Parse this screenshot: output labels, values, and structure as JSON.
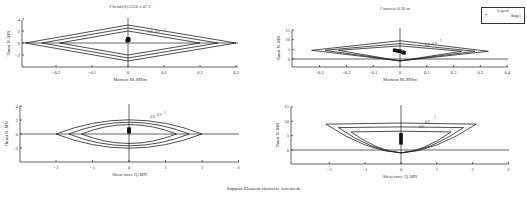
{
  "figure": {
    "caption": "Support Element shotcrete wiremesh",
    "legend": {
      "title": "Legend",
      "entries": [
        {
          "marker": "*",
          "label": "Stage1"
        }
      ]
    }
  },
  "chart_data": [
    {
      "id": "tl",
      "type": "line",
      "title": "I-beam(S):5310 x 47.3",
      "xlabel": "Moment M–MNm",
      "ylabel": "Thrust N–MN",
      "xlim": [
        -0.3,
        0.3
      ],
      "ylim": [
        -4,
        4
      ],
      "xticks": [
        -0.2,
        -0.1,
        0,
        0.1,
        0.2,
        0.3
      ],
      "yticks": [
        4,
        2,
        0,
        -2
      ],
      "curve_labels": [
        "0.8",
        "0.9",
        "1"
      ],
      "series": [
        {
          "name": "FS=1",
          "points": [
            [
              -0.285,
              0
            ],
            [
              0,
              3
            ],
            [
              0.3,
              0
            ],
            [
              0,
              -3
            ],
            [
              -0.285,
              0
            ]
          ]
        },
        {
          "name": "FS=0.9",
          "points": [
            [
              -0.24,
              0
            ],
            [
              0,
              2.5
            ],
            [
              0.25,
              0
            ],
            [
              0,
              -2.5
            ],
            [
              -0.24,
              0
            ]
          ]
        },
        {
          "name": "FS=0.8",
          "points": [
            [
              -0.19,
              0
            ],
            [
              0,
              2
            ],
            [
              0.2,
              0
            ],
            [
              0,
              -2
            ],
            [
              -0.19,
              0
            ]
          ]
        }
      ],
      "stage_points": {
        "name": "Stage1",
        "x": [
          -0.002,
          0,
          0.002,
          0.001
        ],
        "y": [
          0.4,
          0.7,
          0.5,
          0.6
        ]
      }
    },
    {
      "id": "tr",
      "type": "line",
      "title": "Concrete:0.36 m",
      "xlabel": "Moment M–MNm",
      "ylabel": "Thrust N–MN",
      "xlim": [
        -0.4,
        0.4
      ],
      "ylim": [
        -5,
        15
      ],
      "xticks": [
        -0.3,
        -0.2,
        -0.1,
        0,
        0.1,
        0.2,
        0.3,
        0.4
      ],
      "yticks": [
        15,
        10,
        5,
        0
      ],
      "curve_labels": [
        "0.8",
        "0.9",
        "1"
      ],
      "series": [
        {
          "name": "FS=1",
          "points": [
            [
              -0.33,
              4.5
            ],
            [
              0,
              9.5
            ],
            [
              0.33,
              4
            ],
            [
              0,
              -1
            ],
            [
              -0.33,
              4.5
            ]
          ]
        },
        {
          "name": "FS=0.9",
          "points": [
            [
              -0.28,
              4.5
            ],
            [
              0,
              8
            ],
            [
              0.28,
              4
            ],
            [
              0,
              -1
            ],
            [
              -0.28,
              4.5
            ]
          ]
        },
        {
          "name": "FS=0.8",
          "points": [
            [
              -0.23,
              4.5
            ],
            [
              0,
              6.8
            ],
            [
              0.23,
              4
            ],
            [
              0,
              -1
            ],
            [
              -0.23,
              4.5
            ]
          ]
        }
      ],
      "stage_points": {
        "name": "Stage1",
        "x": [
          -0.02,
          -0.01,
          0,
          0.01,
          0.015
        ],
        "y": [
          4.5,
          4.2,
          4.0,
          3.5,
          3.2
        ]
      }
    },
    {
      "id": "bl",
      "type": "line",
      "title": "",
      "xlabel": "Shear force Q–MN",
      "ylabel": "Thrust N–MN",
      "xlim": [
        -3,
        3
      ],
      "ylim": [
        -4,
        4
      ],
      "xticks": [
        -2,
        -1,
        0,
        1,
        2,
        3
      ],
      "yticks": [
        4,
        2,
        0,
        -2
      ],
      "curve_labels": [
        "0.8",
        "0.9",
        "1"
      ],
      "series": [
        {
          "name": "FS=1",
          "outer_x": 2.0,
          "top": 3,
          "bottom": -3
        },
        {
          "name": "FS=0.9",
          "outer_x": 1.65,
          "top": 2.5,
          "bottom": -2.5
        },
        {
          "name": "FS=0.8",
          "outer_x": 1.3,
          "top": 2,
          "bottom": -2
        }
      ],
      "stage_points": {
        "name": "Stage1",
        "x": [
          0,
          0,
          0
        ],
        "y": [
          0.3,
          0.5,
          0.7
        ]
      }
    },
    {
      "id": "br",
      "type": "line",
      "title": "",
      "xlabel": "Shear force Q–MN",
      "ylabel": "Thrust N–MN",
      "xlim": [
        -3,
        3
      ],
      "ylim": [
        -5,
        15
      ],
      "xticks": [
        -2,
        -1,
        0,
        1,
        2,
        3
      ],
      "yticks": [
        15,
        10,
        5,
        0
      ],
      "curve_labels": [
        "0.8",
        "0.9",
        "1"
      ],
      "series": [
        {
          "name": "FS=1",
          "outer_x": 2.1,
          "top": 9.8,
          "corner": 9,
          "bottom": -1
        },
        {
          "name": "FS=0.9",
          "outer_x": 1.75,
          "top": 8.3,
          "corner": 7.8,
          "bottom": -1
        },
        {
          "name": "FS=0.8",
          "outer_x": 1.4,
          "top": 6.8,
          "corner": 6.3,
          "bottom": -1
        }
      ],
      "stage_points": {
        "name": "Stage1",
        "x": [
          0,
          0,
          0,
          0
        ],
        "y": [
          2.5,
          3.5,
          4.5,
          5.3
        ]
      }
    }
  ]
}
